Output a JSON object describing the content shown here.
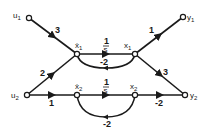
{
  "diagram": {
    "type": "signal-flow-graph",
    "nodes": [
      {
        "id": "u1",
        "label": "u1",
        "x": 29,
        "y": 18
      },
      {
        "id": "u2",
        "label": "u2",
        "x": 27,
        "y": 95
      },
      {
        "id": "xdot1",
        "label": "ẋ1",
        "x": 77,
        "y": 54
      },
      {
        "id": "x1",
        "label": "x1",
        "x": 135,
        "y": 54
      },
      {
        "id": "xdot2",
        "label": "ẋ2",
        "x": 77,
        "y": 95
      },
      {
        "id": "x2",
        "label": "x2",
        "x": 135,
        "y": 95
      },
      {
        "id": "y1",
        "label": "y1",
        "x": 183,
        "y": 17
      },
      {
        "id": "y2",
        "label": "y2",
        "x": 185,
        "y": 95
      }
    ],
    "edges": [
      {
        "from": "u1",
        "to": "xdot1",
        "gain": "3"
      },
      {
        "from": "u2",
        "to": "xdot1",
        "gain": "2"
      },
      {
        "from": "u2",
        "to": "xdot2",
        "gain": "1"
      },
      {
        "from": "xdot1",
        "to": "x1",
        "gain_num": "1",
        "gain_den": "s"
      },
      {
        "from": "x1",
        "to": "xdot1",
        "gain": "-2"
      },
      {
        "from": "xdot2",
        "to": "x2",
        "gain_num": "1",
        "gain_den": "s"
      },
      {
        "from": "x2",
        "to": "xdot2",
        "gain": "-2"
      },
      {
        "from": "x1",
        "to": "y1",
        "gain": "1"
      },
      {
        "from": "x1",
        "to": "y2",
        "gain": "3"
      },
      {
        "from": "x2",
        "to": "y2",
        "gain": "-2"
      }
    ]
  },
  "labels": {
    "u1": "u",
    "u1_sub": "1",
    "u2": "u",
    "u2_sub": "2",
    "y1": "y",
    "y1_sub": "1",
    "y2": "y",
    "y2_sub": "2",
    "xdot1": "ẋ",
    "xdot1_sub": "1",
    "x1": "x",
    "x1_sub": "1",
    "xdot2": "ẋ",
    "xdot2_sub": "2",
    "x2": "x",
    "x2_sub": "2",
    "g_u1_xdot1": "3",
    "g_u2_xdot1": "2",
    "g_u2_xdot2": "1",
    "g_int1_num": "1",
    "g_int1_den": "s",
    "g_fb1": "-2",
    "g_int2_num": "1",
    "g_int2_den": "s",
    "g_fb2": "-2",
    "g_x1_y1": "1",
    "g_x1_y2": "3",
    "g_x2_y2": "-2"
  }
}
